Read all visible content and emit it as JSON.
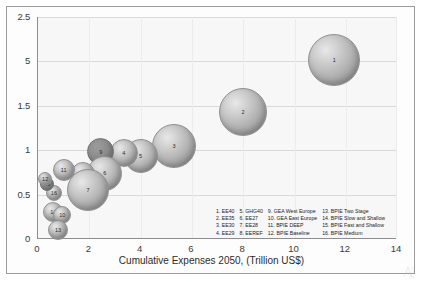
{
  "chart_data": {
    "type": "scatter",
    "title": "",
    "xlabel": "Cumulative Expenses 2050, (Trillion US$)",
    "ylabel": "",
    "xlim": [
      0,
      14
    ],
    "ylim": [
      0,
      2.5
    ],
    "grid": true,
    "legend_position": "inside-bottom-right",
    "xticks": [
      "0",
      "2",
      "4",
      "6",
      "8",
      "10",
      "12",
      "14"
    ],
    "xtick_values": [
      0,
      2,
      4,
      6,
      8,
      10,
      12,
      14
    ],
    "yticks": [
      "0",
      "0.5",
      "1",
      "1.5",
      "5",
      "2.5"
    ],
    "ytick_values": [
      0,
      0.5,
      1,
      1.5,
      2,
      2.5
    ],
    "bubbles": [
      {
        "id": 1,
        "label": "1",
        "name": "EE40",
        "x": 11.55,
        "y": 2.02,
        "r": 26
      },
      {
        "id": 2,
        "label": "2",
        "name": "EE35",
        "x": 8.0,
        "y": 1.43,
        "r": 24
      },
      {
        "id": 3,
        "label": "3",
        "name": "EE30",
        "x": 5.3,
        "y": 1.05,
        "r": 22
      },
      {
        "id": 5,
        "label": "5",
        "name": "GHG40",
        "x": 4.0,
        "y": 0.93,
        "r": 17
      },
      {
        "id": 4,
        "label": "4",
        "name": "EE29",
        "x": 3.35,
        "y": 0.97,
        "r": 14
      },
      {
        "id": 9,
        "label": "9",
        "name": "GEA West Europe",
        "x": 2.45,
        "y": 0.98,
        "r": 13.5
      },
      {
        "id": 6,
        "label": "6",
        "name": "EE27",
        "x": 2.6,
        "y": 0.74,
        "r": 17.5
      },
      {
        "id": 8,
        "label": "8",
        "name": "EEREF",
        "x": 1.75,
        "y": 0.73,
        "r": 12
      },
      {
        "id": 7,
        "label": "7",
        "name": "EE28",
        "x": 1.95,
        "y": 0.55,
        "r": 21
      },
      {
        "id": 11,
        "label": "11",
        "name": "BPIE DEEP",
        "x": 1.0,
        "y": 0.78,
        "r": 11
      },
      {
        "id": 16,
        "label": "16",
        "name": "BPIE Medium",
        "x": 0.62,
        "y": 0.52,
        "r": 8
      },
      {
        "id": 15,
        "label": "15",
        "name": "BPIE Fast and Shallow",
        "x": 0.35,
        "y": 0.62,
        "r": 7
      },
      {
        "id": 14,
        "label": "14",
        "name": "BPIE Slow and Shallow",
        "x": 0.6,
        "y": 0.3,
        "r": 10
      },
      {
        "id": 10,
        "label": "10",
        "name": "GEA East Europe",
        "x": 0.95,
        "y": 0.27,
        "r": 9
      },
      {
        "id": 13,
        "label": "13",
        "name": "BPIE Two Stage",
        "x": 0.78,
        "y": 0.1,
        "r": 10
      },
      {
        "id": 12,
        "label": "12",
        "name": "BPIE Baseline",
        "x": 0.28,
        "y": 0.68,
        "r": 7
      }
    ],
    "legend": {
      "columns": [
        [
          {
            "num": "1.",
            "label": "EE40"
          },
          {
            "num": "2.",
            "label": "EE35"
          },
          {
            "num": "3.",
            "label": "EE30"
          },
          {
            "num": "4.",
            "label": "EE29"
          }
        ],
        [
          {
            "num": "5.",
            "label": "GHG40"
          },
          {
            "num": "6.",
            "label": "EE27"
          },
          {
            "num": "7.",
            "label": "EE28"
          },
          {
            "num": "8.",
            "label": "EEREF"
          }
        ],
        [
          {
            "num": "9.",
            "label": "GEA West Europe"
          },
          {
            "num": "10.",
            "label": "GEA East Europe"
          },
          {
            "num": "11.",
            "label": "BPIE DEEP"
          },
          {
            "num": "12.",
            "label": "BPIE Baseline"
          }
        ],
        [
          {
            "num": "13.",
            "label": "BPIE Two Stage"
          },
          {
            "num": "14.",
            "label": "BPIE Slow and Shallow"
          },
          {
            "num": "15.",
            "label": "BPIE Fast and Shallow"
          },
          {
            "num": "16.",
            "label": "BPIE Medium"
          }
        ]
      ]
    },
    "colors": {
      "plot_background": "#f7f7f7",
      "axis": "#8d8d8d",
      "gridline": "#d9d9d9",
      "frame": "#9a9a9a",
      "bubble_light": "#e8e8e8",
      "bubble_mid": "#b9b9b9",
      "bubble_dark": "#8f8f8f",
      "bubble_shaded": "#9b9b9b",
      "text": "#2b2b2b"
    }
  }
}
